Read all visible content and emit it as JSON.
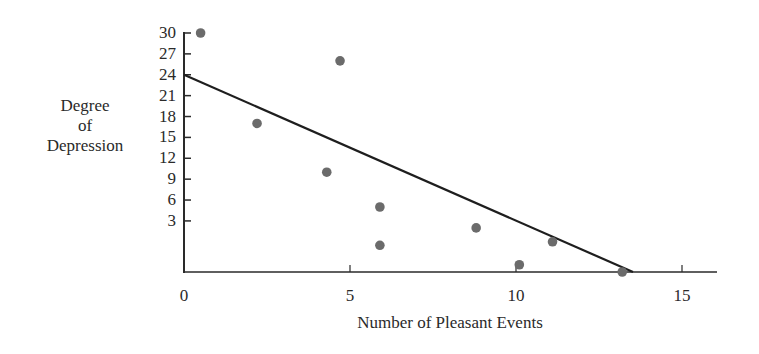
{
  "chart_data": {
    "type": "scatter",
    "title": "",
    "xlabel": "Number of Pleasant Events",
    "ylabel": "Degree of Depression",
    "ylabel_lines": [
      "Degree",
      "of",
      "Depression"
    ],
    "x_ticks": [
      0,
      5,
      10,
      15
    ],
    "y_ticks": [
      3,
      6,
      9,
      12,
      15,
      18,
      21,
      24,
      27,
      30
    ],
    "xlim": [
      0,
      16
    ],
    "ylim": [
      -4.5,
      30
    ],
    "grid": false,
    "legend": null,
    "points": [
      {
        "x": 0.5,
        "y": 30
      },
      {
        "x": 2.2,
        "y": 17
      },
      {
        "x": 4.3,
        "y": 10
      },
      {
        "x": 4.7,
        "y": 26
      },
      {
        "x": 5.9,
        "y": 5
      },
      {
        "x": 5.9,
        "y": -0.5
      },
      {
        "x": 8.8,
        "y": 2
      },
      {
        "x": 10.1,
        "y": -3.3
      },
      {
        "x": 11.1,
        "y": 0
      },
      {
        "x": 13.2,
        "y": -4.5
      }
    ],
    "regression_line": {
      "x0": 0,
      "y0": 24,
      "x1": 13.5,
      "y1": -4.5
    },
    "colors": {
      "points": "#6b6b6b",
      "line": "#1e1e1e",
      "axes": "#2a2a2a"
    }
  }
}
